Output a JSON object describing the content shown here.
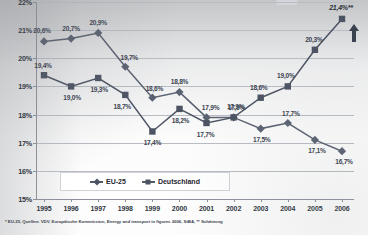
{
  "chart_data": {
    "type": "line",
    "title": "",
    "xlabel": "",
    "ylabel": "",
    "ylim": [
      15,
      22
    ],
    "ytick_labels": [
      "15%",
      "16%",
      "17%",
      "18%",
      "19%",
      "20%",
      "21%",
      "22%"
    ],
    "ytick_values": [
      15,
      16,
      17,
      18,
      19,
      20,
      21,
      22
    ],
    "grid": true,
    "legend_position": "bottom-center",
    "categories": [
      "1995",
      "1996",
      "1997",
      "1998",
      "1999",
      "2000",
      "2001",
      "2002",
      "2003",
      "2004",
      "2005",
      "2006"
    ],
    "series": [
      {
        "name": "EU-25",
        "marker": "diamond",
        "values": [
          20.6,
          20.7,
          20.9,
          19.7,
          18.6,
          18.8,
          17.9,
          17.9,
          17.5,
          17.7,
          17.1,
          16.7
        ],
        "labels": [
          "20,6%",
          "20,7%",
          "20,9%",
          "19,7%",
          "18,6%",
          "18,8%",
          "17,9%",
          "17,9%",
          "17,5%",
          "17,7%",
          "17,1%",
          "16,7%"
        ]
      },
      {
        "name": "Deutschland",
        "marker": "square",
        "values": [
          19.4,
          19.0,
          19.3,
          18.7,
          17.4,
          18.2,
          17.7,
          17.9,
          18.6,
          19.0,
          20.3,
          21.4
        ],
        "labels": [
          "19,4%",
          "19,0%",
          "19,3%",
          "18,7%",
          "17,4%",
          "18,2%",
          "17,7%",
          "17,9%",
          "18,6%",
          "19,0%",
          "20,3%",
          "21,4%**"
        ]
      }
    ],
    "annotations": {
      "trend_arrow": "up-arrow",
      "estimate_marker": "**"
    },
    "colors": {
      "eu25": "#5a6170",
      "deutschland": "#4c5463",
      "gridline": "#b9bcc2",
      "axis": "#8d9199",
      "text": "#2e3540"
    }
  },
  "legend": {
    "items": [
      {
        "label": "EU-25",
        "marker": "diamond"
      },
      {
        "label": "Deutschland",
        "marker": "square"
      }
    ]
  },
  "footnote": {
    "text": "* EU-25, Quellen: VDV, Europäische Kommission, Energy and transport in figures 2006, StBA, ** Schätzung"
  }
}
